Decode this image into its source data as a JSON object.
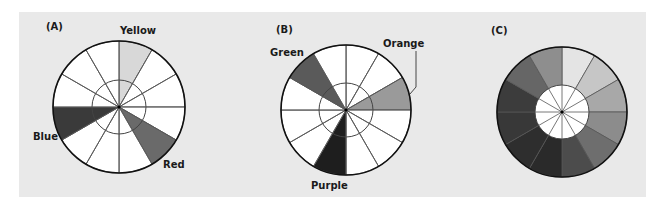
{
  "figure": {
    "panels": [
      {
        "id": "A",
        "label": "(A)",
        "label_pos": [
          46,
          21
        ],
        "center": [
          119,
          107
        ],
        "outer_r": 66,
        "inner_r": 27,
        "segments": 12,
        "inner_fill": null,
        "fills": [
          "#d8d8d8",
          "#ffffff",
          "#ffffff",
          "#ffffff",
          "#6a6a6a",
          "#ffffff",
          "#ffffff",
          "#ffffff",
          "#3a3a3a",
          "#ffffff",
          "#ffffff",
          "#ffffff"
        ],
        "callouts": [
          {
            "text": "Yellow",
            "x": 120,
            "y": 25
          },
          {
            "text": "Red",
            "x": 163,
            "y": 159
          },
          {
            "text": "Blue",
            "x": 33,
            "y": 131
          }
        ]
      },
      {
        "id": "B",
        "label": "(B)",
        "label_pos": [
          276,
          24
        ],
        "center": [
          346,
          110
        ],
        "outer_r": 65,
        "inner_r": 27,
        "segments": 12,
        "inner_fill": null,
        "fills": [
          "#ffffff",
          "#ffffff",
          "#9a9a9a",
          "#ffffff",
          "#ffffff",
          "#ffffff",
          "#1e1e1e",
          "#ffffff",
          "#ffffff",
          "#ffffff",
          "#5a5a5a",
          "#ffffff"
        ],
        "callouts": [
          {
            "text": "Green",
            "x": 270,
            "y": 47
          },
          {
            "text": "Orange",
            "x": 383,
            "y": 38
          },
          {
            "text": "Purple",
            "x": 311,
            "y": 180
          }
        ],
        "leader": [
          [
            416,
            51
          ],
          [
            416,
            87
          ],
          [
            410,
            94
          ]
        ]
      },
      {
        "id": "C",
        "label": "(C)",
        "label_pos": [
          491,
          25
        ],
        "center": [
          562,
          112
        ],
        "outer_r": 65,
        "inner_r": 27,
        "segments": 12,
        "inner_fill": "#ffffff",
        "fills": [
          "#e4e4e4",
          "#c6c6c6",
          "#a8a8a8",
          "#8c8c8c",
          "#6e6e6e",
          "#4c4c4c",
          "#2a2a2a",
          "#2e2e2e",
          "#383838",
          "#3c3c3c",
          "#666666",
          "#8e8e8e"
        ],
        "callouts": []
      }
    ]
  }
}
